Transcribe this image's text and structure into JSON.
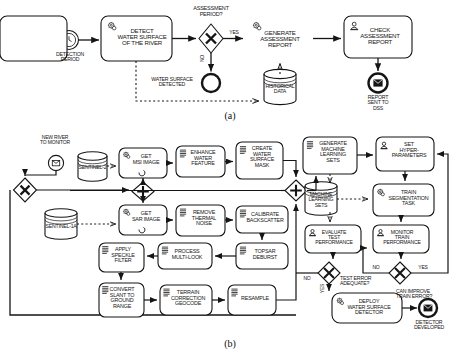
{
  "figure": {
    "panel_a_caption": "(a)",
    "panel_b_caption": "(b)"
  },
  "panel_a": {
    "start_event": {
      "name": "timer-start-event",
      "label": "DETECTION\nPERIOD"
    },
    "tasks": [
      {
        "id": "detect",
        "label": "DETECT\nWATER SURFACE\nOF THE RIVER",
        "icon": "service-task-icon"
      },
      {
        "id": "generate",
        "label": "GENERATE\nASSESSMENT\nREPORT",
        "icon": "service-task-icon"
      },
      {
        "id": "check",
        "label": "CHECK\nASSESSMENT\nREPORT",
        "icon": "user-task-icon"
      }
    ],
    "gateway": {
      "label": "ASSESSMENT\nPERIOD?",
      "type": "exclusive-gateway"
    },
    "flow_labels": {
      "yes": "YES",
      "no": "NO"
    },
    "end_events": [
      {
        "id": "water-surface-detected",
        "label": "WATER SURFACE\nDETECTED",
        "type": "none-end-event"
      },
      {
        "id": "report-sent",
        "label": "REPORT\nSENT TO\nDSS",
        "type": "message-end-event"
      }
    ],
    "datastore": {
      "label": "HISTORICAL\nDATA",
      "type": "data-store"
    }
  },
  "panel_b": {
    "start_event": {
      "name": "message-start-event",
      "label": "NEW RIVER\nTO MONITOR"
    },
    "datastores": [
      {
        "id": "sentinel2",
        "label": "SENTINEL-2"
      },
      {
        "id": "sentinel1a",
        "label": "SENTINEL-1A"
      },
      {
        "id": "mlsets",
        "label": "MACHINE\nLEARNING\nSETS"
      }
    ],
    "tasks": [
      {
        "id": "get-msi",
        "label": "GET\nMSI IMAGE",
        "icon": "service-task-icon",
        "marker": "loop-marker"
      },
      {
        "id": "enhance-water",
        "label": "ENHANCE\nWATER\nFEATURE",
        "icon": "script-task-icon"
      },
      {
        "id": "create-mask",
        "label": "CREATE\nWATER\nSURFACE\nMASK",
        "icon": "script-task-icon"
      },
      {
        "id": "get-sar",
        "label": "GET\nSAR IMAGE",
        "icon": "service-task-icon",
        "marker": "loop-marker"
      },
      {
        "id": "remove-thermal",
        "label": "REMOVE\nTHERMAL\nNOISE",
        "icon": "script-task-icon"
      },
      {
        "id": "calibrate",
        "label": "CALIBRATE\nBACKSCATTER",
        "icon": "script-task-icon"
      },
      {
        "id": "topsar",
        "label": "TOPSAR\nDEBURST",
        "icon": "script-task-icon"
      },
      {
        "id": "multilook",
        "label": "PROCESS\nMULTI-LOOK",
        "icon": "script-task-icon"
      },
      {
        "id": "speckle",
        "label": "APPLY\nSPECKLE\nFILTER",
        "icon": "script-task-icon"
      },
      {
        "id": "slant",
        "label": "CONVERT\nSLANT TO\nGROUND\nRANGE",
        "icon": "script-task-icon"
      },
      {
        "id": "terrain",
        "label": "TERRAIN\nCORRECTION\nGEOCODE",
        "icon": "script-task-icon"
      },
      {
        "id": "resample",
        "label": "RESAMPLE",
        "icon": "script-task-icon"
      },
      {
        "id": "gen-ml",
        "label": "GENERATE\nMACHINE\nLEARNING\nSETS",
        "icon": "script-task-icon"
      },
      {
        "id": "hyper",
        "label": "SET\nHYPER-\nPARAMETERS",
        "icon": "user-task-icon"
      },
      {
        "id": "train",
        "label": "TRAIN\nSEGMENTATION\nTASK",
        "icon": "service-task-icon"
      },
      {
        "id": "eval-test",
        "label": "EVALUATE\nTEST\nPERFORMANCE",
        "icon": "user-task-icon"
      },
      {
        "id": "monitor-train",
        "label": "MONITOR\nTRAIN\nPERFORMANCE",
        "icon": "user-task-icon"
      },
      {
        "id": "deploy",
        "label": "DEPLOY\nWATER SURFACE\nDETECTOR",
        "icon": "service-task-icon"
      }
    ],
    "gateways": [
      {
        "id": "gw-merge-left",
        "type": "exclusive-gateway",
        "label": ""
      },
      {
        "id": "gw-parallel-split",
        "type": "parallel-gateway",
        "label": ""
      },
      {
        "id": "gw-parallel-join",
        "type": "parallel-gateway",
        "label": ""
      },
      {
        "id": "gw-test-error",
        "type": "exclusive-gateway",
        "label": "TEST ERROR\nADEQUATE?"
      },
      {
        "id": "gw-train-error",
        "type": "exclusive-gateway",
        "label": "CAN IMPROVE\nTRAIN ERROR?"
      }
    ],
    "flow_labels": {
      "test_no": "NO",
      "test_yes": "YES",
      "train_no": "NO",
      "train_yes": "YES"
    },
    "end_event": {
      "id": "detector-developed",
      "label": "DETECTOR\nDEVELOPED",
      "type": "message-end-event"
    }
  },
  "style": {
    "stroke": "#151515",
    "fill": "#ffffff",
    "background": "#ffffff"
  }
}
